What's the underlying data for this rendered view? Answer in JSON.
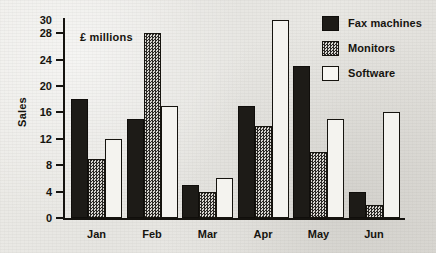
{
  "chart_data": {
    "type": "bar",
    "title": "",
    "subtitle": "",
    "annotation": "£ millions",
    "xlabel": "",
    "ylabel": "Sales",
    "categories": [
      "Jan",
      "Feb",
      "Mar",
      "Apr",
      "May",
      "Jun"
    ],
    "series": [
      {
        "name": "Fax machines",
        "values": [
          18,
          15,
          5,
          17,
          23,
          4
        ],
        "color": "#1d1b17",
        "fill": "solid-black"
      },
      {
        "name": "Monitors",
        "values": [
          9,
          28,
          4,
          14,
          10,
          2
        ],
        "color": "#575451",
        "fill": "checkered-gray"
      },
      {
        "name": "Software",
        "values": [
          12,
          17,
          6,
          30,
          15,
          16
        ],
        "color": "#f4f3ef",
        "fill": "white-outline"
      }
    ],
    "ylim": [
      0,
      30
    ],
    "yticks": [
      0,
      4,
      8,
      12,
      16,
      20,
      24,
      28,
      30
    ],
    "ytick_labels": [
      "0",
      "4",
      "8",
      "12",
      "16",
      "20",
      "24",
      "28",
      "30"
    ],
    "grid": false,
    "legend_position": "top-right",
    "orientation": "vertical",
    "grouping": "clustered"
  },
  "axis": {
    "y_title": "Sales",
    "units_note": "£ millions",
    "ticks": [
      {
        "value": 30,
        "label": "30",
        "has_mark": false
      },
      {
        "value": 28,
        "label": "28",
        "has_mark": true
      },
      {
        "value": 24,
        "label": "24",
        "has_mark": true
      },
      {
        "value": 20,
        "label": "20",
        "has_mark": true
      },
      {
        "value": 16,
        "label": "16",
        "has_mark": true
      },
      {
        "value": 12,
        "label": "12",
        "has_mark": true
      },
      {
        "value": 8,
        "label": "8",
        "has_mark": true
      },
      {
        "value": 4,
        "label": "4",
        "has_mark": true
      },
      {
        "value": 0,
        "label": "0",
        "has_mark": true
      }
    ]
  },
  "legend": {
    "items": [
      {
        "label": "Fax machines",
        "swatch": "solid-black-swatch"
      },
      {
        "label": "Monitors",
        "swatch": "checkered-gray-swatch"
      },
      {
        "label": "Software",
        "swatch": "white-outline-swatch"
      }
    ]
  }
}
